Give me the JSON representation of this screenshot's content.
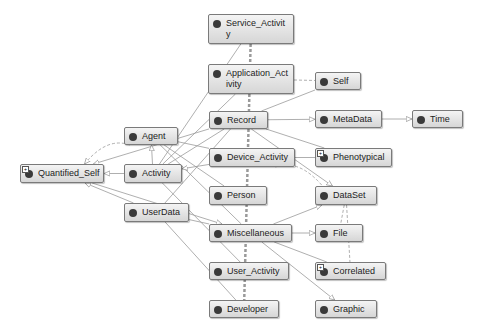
{
  "diagram": {
    "type": "ontology-graph",
    "nodes": [
      {
        "id": "service_activity",
        "label": "Service_Activit\ny",
        "x": 208,
        "y": 14,
        "w": 86,
        "h": 30,
        "expandable": false
      },
      {
        "id": "application_activity",
        "label": "Application_Act\nivity",
        "x": 208,
        "y": 64,
        "w": 86,
        "h": 30,
        "expandable": false
      },
      {
        "id": "self",
        "label": "Self",
        "x": 315,
        "y": 72,
        "w": 46,
        "h": 18,
        "expandable": false
      },
      {
        "id": "agent",
        "label": "Agent",
        "x": 124,
        "y": 127,
        "w": 54,
        "h": 18,
        "expandable": false
      },
      {
        "id": "record",
        "label": "Record",
        "x": 209,
        "y": 111,
        "w": 59,
        "h": 18,
        "expandable": false
      },
      {
        "id": "metadata",
        "label": "MetaData",
        "x": 315,
        "y": 110,
        "w": 67,
        "h": 18,
        "expandable": false
      },
      {
        "id": "time",
        "label": "Time",
        "x": 412,
        "y": 110,
        "w": 51,
        "h": 18,
        "expandable": false
      },
      {
        "id": "quantified_self",
        "label": "Quantified_Self",
        "x": 20,
        "y": 164,
        "w": 84,
        "h": 19,
        "expandable": true
      },
      {
        "id": "activity",
        "label": "Activity",
        "x": 124,
        "y": 164,
        "w": 58,
        "h": 19,
        "expandable": false
      },
      {
        "id": "device_activity",
        "label": "Device_Activity",
        "x": 209,
        "y": 148,
        "w": 86,
        "h": 19,
        "expandable": false
      },
      {
        "id": "phenotypical",
        "label": "Phenotypical",
        "x": 315,
        "y": 148,
        "w": 77,
        "h": 19,
        "expandable": true
      },
      {
        "id": "person",
        "label": "Person",
        "x": 209,
        "y": 186,
        "w": 58,
        "h": 19,
        "expandable": false
      },
      {
        "id": "dataset",
        "label": "DataSet",
        "x": 315,
        "y": 186,
        "w": 62,
        "h": 19,
        "expandable": false
      },
      {
        "id": "userdata",
        "label": "UserData",
        "x": 124,
        "y": 203,
        "w": 65,
        "h": 19,
        "expandable": false
      },
      {
        "id": "miscellaneous",
        "label": "Miscellaneous",
        "x": 209,
        "y": 224,
        "w": 83,
        "h": 18,
        "expandable": false
      },
      {
        "id": "file",
        "label": "File",
        "x": 315,
        "y": 224,
        "w": 48,
        "h": 18,
        "expandable": false
      },
      {
        "id": "user_activity",
        "label": "User_Activity",
        "x": 209,
        "y": 262,
        "w": 80,
        "h": 18,
        "expandable": false
      },
      {
        "id": "correlated",
        "label": "Correlated",
        "x": 315,
        "y": 262,
        "w": 71,
        "h": 18,
        "expandable": true
      },
      {
        "id": "developer",
        "label": "Developer",
        "x": 209,
        "y": 300,
        "w": 70,
        "h": 18,
        "expandable": false
      },
      {
        "id": "graphic",
        "label": "Graphic",
        "x": 315,
        "y": 300,
        "w": 62,
        "h": 18,
        "expandable": false
      }
    ],
    "edges": [
      {
        "from": "service_activity",
        "to": "activity",
        "style": "solid"
      },
      {
        "from": "service_activity",
        "to": "developer",
        "style": "dashed-double"
      },
      {
        "from": "application_activity",
        "to": "activity",
        "style": "solid"
      },
      {
        "from": "application_activity",
        "to": "self",
        "style": "dashed"
      },
      {
        "from": "record",
        "to": "metadata",
        "style": "solid",
        "arrow": "open"
      },
      {
        "from": "record",
        "to": "self",
        "style": "solid"
      },
      {
        "from": "record",
        "to": "dataset",
        "style": "solid",
        "arrow": "open"
      },
      {
        "from": "record",
        "to": "phenotypical",
        "style": "solid"
      },
      {
        "from": "record",
        "to": "quantified_self",
        "style": "solid",
        "arrow": "open"
      },
      {
        "from": "metadata",
        "to": "time",
        "style": "solid",
        "arrow": "open"
      },
      {
        "from": "agent",
        "to": "quantified_self",
        "style": "dashed",
        "arrow": "open"
      },
      {
        "from": "agent",
        "to": "device_activity",
        "style": "solid"
      },
      {
        "from": "agent",
        "to": "miscellaneous",
        "style": "solid"
      },
      {
        "from": "activity",
        "to": "agent",
        "style": "solid",
        "arrow": "open"
      },
      {
        "from": "activity",
        "to": "quantified_self",
        "style": "solid",
        "arrow": "open"
      },
      {
        "from": "activity",
        "to": "record",
        "style": "solid"
      },
      {
        "from": "device_activity",
        "to": "activity",
        "style": "solid",
        "arrow": "open"
      },
      {
        "from": "device_activity",
        "to": "dataset",
        "style": "dashed"
      },
      {
        "from": "device_activity",
        "to": "phenotypical",
        "style": "solid"
      },
      {
        "from": "userdata",
        "to": "quantified_self",
        "style": "solid",
        "arrow": "open"
      },
      {
        "from": "userdata",
        "to": "miscellaneous",
        "style": "solid"
      },
      {
        "from": "userdata",
        "to": "record",
        "style": "solid"
      },
      {
        "from": "userdata",
        "to": "developer",
        "style": "solid"
      },
      {
        "from": "person",
        "to": "agent",
        "style": "solid"
      },
      {
        "from": "miscellaneous",
        "to": "file",
        "style": "solid",
        "arrow": "open"
      },
      {
        "from": "miscellaneous",
        "to": "correlated",
        "style": "solid"
      },
      {
        "from": "miscellaneous",
        "to": "graphic",
        "style": "solid",
        "arrow": "open"
      },
      {
        "from": "miscellaneous",
        "to": "dataset",
        "style": "solid",
        "arrow": "open"
      },
      {
        "from": "quantified_self",
        "to": "miscellaneous",
        "style": "solid",
        "arrow": "open"
      },
      {
        "from": "dataset",
        "to": "file",
        "style": "dashed"
      },
      {
        "from": "dataset",
        "to": "correlated",
        "style": "dashed"
      },
      {
        "from": "user_activity",
        "to": "activity",
        "style": "solid"
      }
    ]
  }
}
